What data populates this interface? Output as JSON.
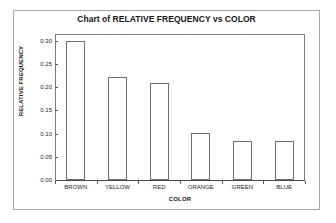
{
  "chart_data": {
    "type": "bar",
    "title": "Chart of RELATIVE FREQUENCY vs COLOR",
    "xlabel": "COLOR",
    "ylabel": "RELATIVE FREQUENCY",
    "categories": [
      "BROWN",
      "YELLOW",
      "RED",
      "ORANGE",
      "GREEN",
      "BLUE"
    ],
    "values": [
      0.3,
      0.223,
      0.209,
      0.101,
      0.085,
      0.085
    ],
    "ylim": [
      0.0,
      0.315
    ],
    "ytick_values": [
      0.0,
      0.05,
      0.1,
      0.15,
      0.2,
      0.25,
      0.3
    ],
    "ytick_labels": [
      "0.00",
      "0.05",
      "0.10",
      "0.15",
      "0.20",
      "0.25",
      "0.30"
    ],
    "grid": false,
    "legend": null,
    "bar_fill_color": "#ffffff",
    "bar_edge_color": "#6e6e6e",
    "axis_color": "#7c7c7c",
    "text_color": "#161616",
    "background_color": "#ffffff"
  }
}
